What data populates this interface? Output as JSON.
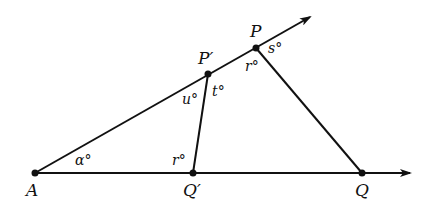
{
  "diagram": {
    "type": "geometry",
    "points": {
      "A": {
        "label": "A",
        "x": 35,
        "y": 173
      },
      "P_prime": {
        "label": "P′",
        "x": 208,
        "y": 74
      },
      "P": {
        "label": "P",
        "x": 256,
        "y": 48
      },
      "Q_prime": {
        "label": "Q′",
        "x": 193,
        "y": 173
      },
      "Q": {
        "label": "Q",
        "x": 362,
        "y": 173
      }
    },
    "rays": [
      {
        "from": "A",
        "through": "P",
        "name": "ray-AP"
      },
      {
        "from": "A",
        "through": "Q",
        "name": "ray-AQ"
      }
    ],
    "segments": [
      {
        "from": "P_prime",
        "to": "Q_prime"
      },
      {
        "from": "P",
        "to": "Q"
      }
    ],
    "angles": {
      "alpha": "α°",
      "u": "u°",
      "t": "t°",
      "r_at_P": "r°",
      "s": "s°",
      "r_at_Q_prime": "r°"
    }
  }
}
